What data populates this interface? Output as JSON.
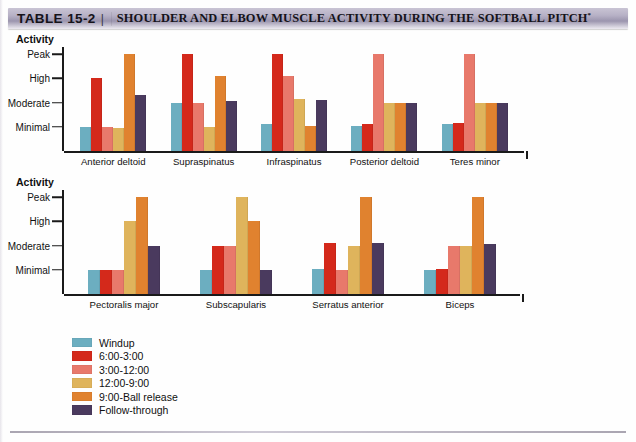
{
  "header": {
    "table_label": "TABLE 15-2",
    "separator": "|",
    "title": "SHOULDER AND ELBOW MUSCLE ACTIVITY DURING THE SOFTBALL PITCH",
    "title_superscript": "*"
  },
  "colors": {
    "windup": "#6CAEC0",
    "six_to_three": "#D4291B",
    "three_to_twelve": "#E8796B",
    "twelve_to_nine": "#DFB45C",
    "nine_to_release": "#E0822F",
    "follow_through": "#4A3A5E",
    "axis": "#1a1a1a",
    "banner_dark": "#9b95ae"
  },
  "legend": {
    "items": [
      {
        "label": "Windup",
        "color": "#6CAEC0"
      },
      {
        "label": "6:00-3:00",
        "color": "#D4291B"
      },
      {
        "label": "3:00-12:00",
        "color": "#E8796B"
      },
      {
        "label": "12:00-9:00",
        "color": "#DFB45C"
      },
      {
        "label": "9:00-Ball release",
        "color": "#E0822F"
      },
      {
        "label": "Follow-through",
        "color": "#4A3A5E"
      }
    ]
  },
  "chart_data": [
    {
      "type": "bar",
      "id": "shoulder-muscles",
      "title": "",
      "ylabel": "Activity",
      "xlabel": "",
      "grid": false,
      "legend_position": "bottom-left",
      "ytick_labels": [
        "Minimal",
        "Moderate",
        "High",
        "Peak"
      ],
      "ytick_values": [
        1,
        2,
        3,
        4
      ],
      "ylim": [
        0,
        4.3
      ],
      "categories": [
        "Anterior deltoid",
        "Supraspinatus",
        "Infraspinatus",
        "Posterior deltoid",
        "Teres minor"
      ],
      "series": [
        {
          "name": "Windup",
          "color": "#6CAEC0",
          "values": [
            1.0,
            2.0,
            1.1,
            1.05,
            1.1
          ]
        },
        {
          "name": "6:00-3:00",
          "color": "#D4291B",
          "values": [
            3.0,
            4.0,
            4.0,
            1.1,
            1.15
          ]
        },
        {
          "name": "3:00-12:00",
          "color": "#E8796B",
          "values": [
            1.0,
            2.0,
            3.1,
            4.0,
            4.0
          ]
        },
        {
          "name": "12:00-9:00",
          "color": "#DFB45C",
          "values": [
            0.95,
            1.0,
            2.15,
            2.0,
            2.0
          ]
        },
        {
          "name": "9:00-Ball release",
          "color": "#E0822F",
          "values": [
            4.0,
            3.1,
            1.05,
            2.0,
            2.0
          ]
        },
        {
          "name": "Follow-through",
          "color": "#4A3A5E",
          "values": [
            2.3,
            2.05,
            2.1,
            2.0,
            2.0
          ]
        }
      ]
    },
    {
      "type": "bar",
      "id": "elbow-and-trunk-muscles",
      "title": "",
      "ylabel": "Activity",
      "xlabel": "",
      "grid": false,
      "legend_position": "bottom-left",
      "ytick_labels": [
        "Minimal",
        "Moderate",
        "High",
        "Peak"
      ],
      "ytick_values": [
        1,
        2,
        3,
        4
      ],
      "ylim": [
        0,
        4.3
      ],
      "categories": [
        "Pectoralis major",
        "Subscapularis",
        "Serratus anterior",
        "Biceps"
      ],
      "series": [
        {
          "name": "Windup",
          "color": "#6CAEC0",
          "values": [
            1.0,
            1.0,
            1.05,
            1.0
          ]
        },
        {
          "name": "6:00-3:00",
          "color": "#D4291B",
          "values": [
            1.0,
            2.0,
            2.1,
            1.05
          ]
        },
        {
          "name": "3:00-12:00",
          "color": "#E8796B",
          "values": [
            1.0,
            2.0,
            1.0,
            2.0
          ]
        },
        {
          "name": "12:00-9:00",
          "color": "#DFB45C",
          "values": [
            3.0,
            4.0,
            2.0,
            2.0
          ]
        },
        {
          "name": "9:00-Ball release",
          "color": "#E0822F",
          "values": [
            4.0,
            3.0,
            4.0,
            4.0
          ]
        },
        {
          "name": "Follow-through",
          "color": "#4A3A5E",
          "values": [
            2.0,
            1.0,
            2.1,
            2.05
          ]
        }
      ]
    }
  ]
}
